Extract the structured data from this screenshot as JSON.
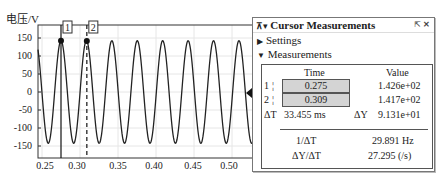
{
  "chart_data": {
    "type": "line",
    "title": "",
    "xlabel": "时间/s",
    "ylabel": "电压/V",
    "xlim": [
      0.245,
      0.53
    ],
    "ylim": [
      -180,
      180
    ],
    "x_ticks": [
      "0.25",
      "0.30",
      "0.35",
      "0.40",
      "0.45",
      "0.50"
    ],
    "y_ticks": [
      "150",
      "100",
      "50",
      "0",
      "-50",
      "-100",
      "-150"
    ],
    "grid": true,
    "series": [
      {
        "name": "voltage",
        "function": "sine",
        "amplitude": 142.6,
        "frequency_hz": 29.891,
        "peak_time": 0.275
      }
    ],
    "cursors": [
      {
        "id": "1",
        "time": 0.275,
        "value": 142.6,
        "style": "solid"
      },
      {
        "id": "2",
        "time": 0.309,
        "value": 141.7,
        "style": "dashed"
      }
    ]
  },
  "plot": {
    "ylabel": "电压/V",
    "xlabel": "时间/s",
    "yticks": [
      "150",
      "100",
      "50",
      "0",
      "-50",
      "-100",
      "-150"
    ],
    "xticks": [
      "0.25",
      "0.30",
      "0.35",
      "0.40",
      "0.45",
      "0.50"
    ],
    "cursor1_label": "1",
    "cursor2_label": "2"
  },
  "panel": {
    "title": "Cursor Measurements",
    "header_icons": "⇱ ✕",
    "collapse_icons": "⊼▾",
    "settings_label": "Settings",
    "measurements_label": "Measurements",
    "col_time": "Time",
    "col_value": "Value",
    "rows": [
      {
        "id": "1",
        "time": "0.275",
        "value": "1.426e+02"
      },
      {
        "id": "2",
        "time": "0.309",
        "value": "1.417e+02"
      }
    ],
    "delta_t_label": "ΔT",
    "delta_t_value": "33.455 ms",
    "delta_y_label": "ΔY",
    "delta_y_value": "9.131e+01",
    "inv_dt_label": "1/ΔT",
    "inv_dt_value": "29.891 Hz",
    "dy_dt_label": "ΔY/ΔT",
    "dy_dt_value": "27.295 (/s)"
  }
}
